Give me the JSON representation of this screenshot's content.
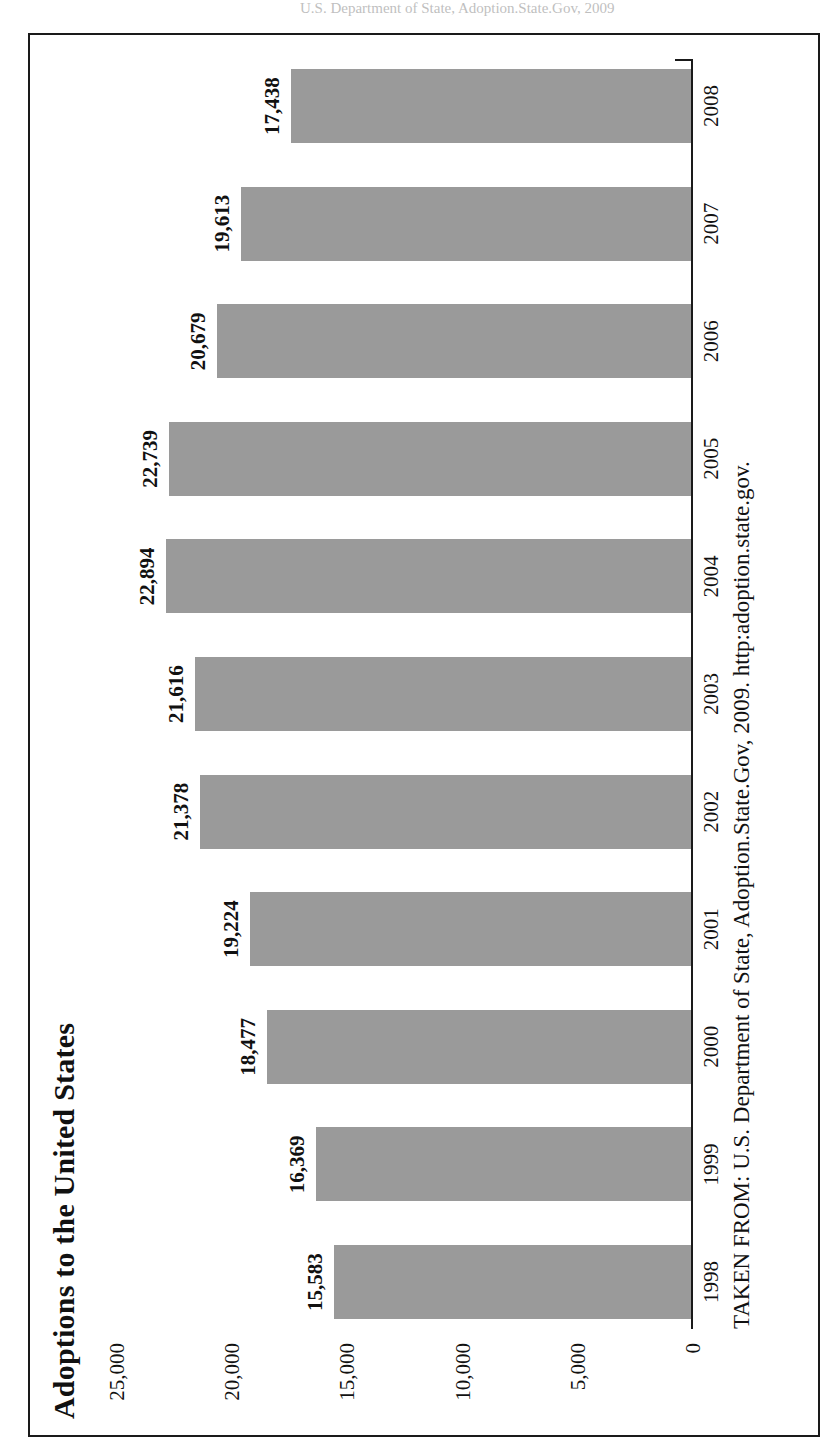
{
  "page": {
    "top_sliver_text": "U.S. Department of State, Adoption.State.Gov, 2009"
  },
  "figure": {
    "title": "Adoptions to the United States",
    "source_note": "TAKEN FROM: U.S. Department of State, Adoption.State.Gov, 2009. http:adoption.state.gov."
  },
  "chart_data": {
    "type": "bar",
    "orientation": "vertical-columns-printed-rotated",
    "title": "Adoptions to the United States",
    "xlabel": "",
    "ylabel": "",
    "ylim": [
      0,
      25000
    ],
    "grid": false,
    "legend": null,
    "categories": [
      "1998",
      "1999",
      "2000",
      "2001",
      "2002",
      "2003",
      "2004",
      "2005",
      "2006",
      "2007",
      "2008"
    ],
    "values": [
      15583,
      16369,
      18477,
      19224,
      21378,
      21616,
      22894,
      22739,
      20679,
      19613,
      17438
    ],
    "value_labels": [
      "15,583",
      "16,369",
      "18,477",
      "19,224",
      "21,378",
      "21,616",
      "22,894",
      "22,739",
      "20,679",
      "19,613",
      "17,438"
    ],
    "tick_labels": [
      "25,000",
      "20,000",
      "15,000",
      "10,000",
      "5,000",
      "0"
    ],
    "tick_values": [
      25000,
      20000,
      15000,
      10000,
      5000,
      0
    ],
    "bar_color": "#9a9a9a",
    "axis_color": "#1a1a1a",
    "frame_color": "#1a1a1a"
  }
}
